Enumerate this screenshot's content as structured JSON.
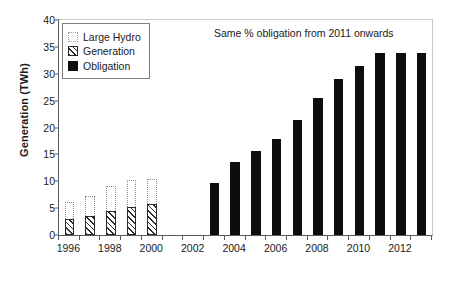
{
  "chart_data": {
    "type": "bar",
    "title": "",
    "xlabel": "",
    "ylabel": "Generation (TWh)",
    "ylim": [
      0,
      40
    ],
    "ytick_values": [
      0,
      5,
      10,
      15,
      20,
      25,
      30,
      35,
      40
    ],
    "ytick_labels": [
      "0",
      "5",
      "10",
      "15",
      "20",
      "25",
      "30",
      "35",
      "40"
    ],
    "grid": false,
    "legend_position": "upper-left",
    "categories": [
      "1996",
      "1997",
      "1998",
      "1999",
      "2000",
      "2001",
      "2002",
      "2003",
      "2004",
      "2005",
      "2006",
      "2007",
      "2008",
      "2009",
      "2010",
      "2011",
      "2012",
      "2013"
    ],
    "xtick_labels": [
      "1996",
      "1998",
      "2000",
      "2002",
      "2004",
      "2006",
      "2008",
      "2010",
      "2012"
    ],
    "stacked": true,
    "series": [
      {
        "name": "Generation",
        "values": [
          3.0,
          3.6,
          4.4,
          5.2,
          5.8,
          null,
          null,
          null,
          null,
          null,
          null,
          null,
          null,
          null,
          null,
          null,
          null,
          null
        ]
      },
      {
        "name": "Large Hydro",
        "values": [
          3.2,
          3.6,
          4.8,
          5.1,
          4.6,
          null,
          null,
          null,
          null,
          null,
          null,
          null,
          null,
          null,
          null,
          null,
          null,
          null
        ]
      },
      {
        "name": "Obligation",
        "values": [
          null,
          null,
          null,
          null,
          null,
          null,
          null,
          9.6,
          13.6,
          15.7,
          17.8,
          21.4,
          25.4,
          29.0,
          31.4,
          33.8,
          33.8,
          33.8
        ]
      }
    ],
    "stack_totals_early": [
      6.2,
      7.2,
      9.2,
      10.3,
      10.4
    ],
    "annotations": [
      {
        "text": "Same % obligation from 2011 onwards"
      }
    ]
  },
  "legend": {
    "items": [
      {
        "label": "Large Hydro",
        "swatch": "dotted-outline-swatch"
      },
      {
        "label": "Generation",
        "swatch": "hatched-swatch"
      },
      {
        "label": "Obligation",
        "swatch": "solid-black-swatch"
      }
    ]
  },
  "colors": {
    "obligation": "#0d0d0d",
    "generation_hatch": "#2b2b2b",
    "hydro_outline": "#8e8e8e",
    "axis": "#5a5a5a"
  }
}
